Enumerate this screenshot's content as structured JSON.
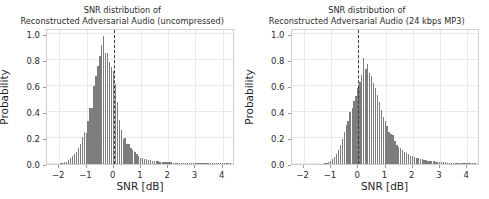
{
  "figure": {
    "width": 489,
    "height": 199,
    "background": "#ffffff",
    "bar_color": "#7d7d7d",
    "grid_color": "#e9e9e9",
    "vline_color": "#3a3a3a"
  },
  "chart_data": [
    {
      "type": "bar",
      "id": "left",
      "title": "SNR distribution of",
      "subtitle": "Reconstructed Adversarial Audio (uncompressed)",
      "xlabel": "SNR [dB]",
      "ylabel": "Probability",
      "xlim": [
        -2.45,
        4.45
      ],
      "ylim": [
        0.0,
        1.05
      ],
      "xticks": [
        -2,
        -1,
        0,
        1,
        2,
        3,
        4
      ],
      "xticklabels": [
        "−2",
        "−1",
        "0",
        "1",
        "2",
        "3",
        "4"
      ],
      "yticks": [
        0.0,
        0.2,
        0.4,
        0.6,
        0.8,
        1.0
      ],
      "yticklabels": [
        "0.0",
        "0.2",
        "0.4",
        "0.6",
        "0.8",
        "1.0"
      ],
      "grid": true,
      "legend": "none",
      "annotations": [
        {
          "kind": "vline",
          "x": 0.0,
          "style": "dashed"
        }
      ],
      "bin_width": 0.0715,
      "x": [
        -1.93,
        -1.86,
        -1.79,
        -1.72,
        -1.64,
        -1.57,
        -1.5,
        -1.43,
        -1.36,
        -1.29,
        -1.21,
        -1.14,
        -1.07,
        -1.0,
        -0.93,
        -0.86,
        -0.79,
        -0.71,
        -0.64,
        -0.57,
        -0.5,
        -0.43,
        -0.36,
        -0.29,
        -0.21,
        -0.14,
        -0.07,
        0.0,
        0.07,
        0.14,
        0.21,
        0.29,
        0.36,
        0.43,
        0.5,
        0.57,
        0.64,
        0.71,
        0.79,
        0.86,
        0.93,
        1.0,
        1.07,
        1.14,
        1.21,
        1.29,
        1.36,
        1.43,
        1.5,
        1.57,
        1.64,
        1.71,
        1.79,
        1.86,
        1.93,
        2.0,
        2.07,
        2.14,
        2.21,
        2.29,
        2.36,
        2.43,
        2.5,
        2.57,
        2.64,
        2.71,
        2.79,
        2.86,
        2.93,
        3.0,
        3.07,
        3.14,
        3.21,
        3.29,
        3.36,
        3.43,
        3.5,
        3.57,
        3.64,
        3.71,
        3.79,
        3.86,
        3.93,
        4.0,
        4.07,
        4.14,
        4.21,
        4.29
      ],
      "values": [
        0.005,
        0.008,
        0.012,
        0.018,
        0.03,
        0.045,
        0.06,
        0.075,
        0.09,
        0.12,
        0.155,
        0.205,
        0.245,
        0.24,
        0.33,
        0.435,
        0.435,
        0.605,
        0.68,
        0.76,
        0.835,
        0.92,
        0.985,
        0.855,
        0.86,
        0.79,
        0.75,
        0.715,
        0.62,
        0.48,
        0.34,
        0.265,
        0.195,
        0.2,
        0.155,
        0.155,
        0.125,
        0.11,
        0.09,
        0.075,
        0.06,
        0.05,
        0.05,
        0.04,
        0.036,
        0.032,
        0.03,
        0.027,
        0.024,
        0.022,
        0.02,
        0.018,
        0.017,
        0.016,
        0.015,
        0.014,
        0.013,
        0.012,
        0.011,
        0.01,
        0.009,
        0.009,
        0.008,
        0.008,
        0.007,
        0.007,
        0.006,
        0.006,
        0.005,
        0.005,
        0.005,
        0.004,
        0.004,
        0.004,
        0.003,
        0.003,
        0.003,
        0.003,
        0.002,
        0.002,
        0.002,
        0.002,
        0.002,
        0.001,
        0.001,
        0.001,
        0.001,
        0.001
      ]
    },
    {
      "type": "bar",
      "id": "right",
      "title": "SNR distribution of",
      "subtitle": "Reconstructed Adversarial Audio (24 kbps MP3)",
      "xlabel": "SNR [dB]",
      "ylabel": "Probability",
      "xlim": [
        -2.45,
        4.45
      ],
      "ylim": [
        0.0,
        1.05
      ],
      "xticks": [
        -2,
        -1,
        0,
        1,
        2,
        3,
        4
      ],
      "xticklabels": [
        "−2",
        "−1",
        "0",
        "1",
        "2",
        "3",
        "4"
      ],
      "yticks": [
        0.0,
        0.2,
        0.4,
        0.6,
        0.8,
        1.0
      ],
      "yticklabels": [
        "0.0",
        "0.2",
        "0.4",
        "0.6",
        "0.8",
        "1.0"
      ],
      "grid": true,
      "legend": "none",
      "annotations": [
        {
          "kind": "vline",
          "x": 0.0,
          "style": "dashed"
        }
      ],
      "bin_width": 0.0715,
      "x": [
        -1.21,
        -1.14,
        -1.07,
        -1.0,
        -0.93,
        -0.86,
        -0.79,
        -0.71,
        -0.64,
        -0.57,
        -0.5,
        -0.43,
        -0.36,
        -0.29,
        -0.21,
        -0.14,
        -0.07,
        0.0,
        0.07,
        0.14,
        0.21,
        0.29,
        0.36,
        0.43,
        0.5,
        0.57,
        0.64,
        0.71,
        0.79,
        0.86,
        0.93,
        1.0,
        1.07,
        1.14,
        1.21,
        1.29,
        1.36,
        1.43,
        1.5,
        1.57,
        1.64,
        1.71,
        1.79,
        1.86,
        1.93,
        2.0,
        2.07,
        2.14,
        2.21,
        2.29,
        2.36,
        2.43,
        2.5,
        2.57,
        2.64,
        2.71,
        2.79,
        2.86,
        2.93,
        3.0,
        3.07,
        3.14,
        3.21,
        3.29,
        3.36,
        3.43,
        3.5,
        3.57,
        3.64,
        3.71,
        3.79,
        3.86,
        3.93,
        4.0,
        4.07,
        4.14,
        4.21,
        4.29
      ],
      "values": [
        0.005,
        0.008,
        0.014,
        0.022,
        0.035,
        0.055,
        0.08,
        0.11,
        0.145,
        0.19,
        0.245,
        0.3,
        0.33,
        0.405,
        0.43,
        0.49,
        0.525,
        0.585,
        0.63,
        0.69,
        0.82,
        0.73,
        0.775,
        0.7,
        0.68,
        0.625,
        0.59,
        0.53,
        0.475,
        0.42,
        0.36,
        0.33,
        0.29,
        0.245,
        0.23,
        0.225,
        0.175,
        0.15,
        0.135,
        0.12,
        0.105,
        0.095,
        0.085,
        0.075,
        0.065,
        0.06,
        0.055,
        0.05,
        0.045,
        0.04,
        0.036,
        0.033,
        0.03,
        0.027,
        0.024,
        0.022,
        0.02,
        0.018,
        0.017,
        0.015,
        0.014,
        0.013,
        0.012,
        0.011,
        0.01,
        0.009,
        0.009,
        0.008,
        0.008,
        0.007,
        0.006,
        0.006,
        0.005,
        0.005,
        0.004,
        0.004,
        0.003,
        0.003
      ]
    }
  ]
}
